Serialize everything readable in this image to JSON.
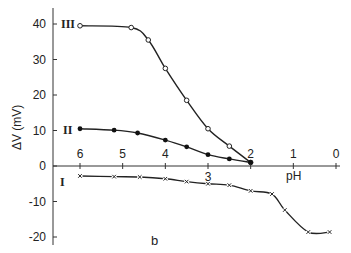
{
  "chart_data": {
    "type": "line",
    "title": "",
    "panel_label": "b",
    "xlabel": "pH",
    "ylabel": "ΔV (mV)",
    "xlim": [
      6,
      0
    ],
    "ylim": [
      -20,
      45
    ],
    "x_ticks": [
      6,
      5,
      4,
      3,
      2,
      1,
      0
    ],
    "y_ticks": [
      40,
      30,
      20,
      10,
      0,
      -10,
      -20
    ],
    "x_axis_reversed": true,
    "x_axis_at_y": 0,
    "grid": false,
    "legend": "inline curve labels (I, II, III)",
    "series": [
      {
        "name": "III",
        "marker": "open-circle",
        "x": [
          6.0,
          4.8,
          4.4,
          4.0,
          3.5,
          3.0,
          2.5,
          2.0
        ],
        "y": [
          39.5,
          39.0,
          35.5,
          27.5,
          18.5,
          10.5,
          5.6,
          1.0
        ]
      },
      {
        "name": "II",
        "marker": "filled-circle",
        "x": [
          6.0,
          5.2,
          4.65,
          4.0,
          3.5,
          3.0,
          2.5,
          2.0
        ],
        "y": [
          10.5,
          10.1,
          9.3,
          7.3,
          5.4,
          3.2,
          2.0,
          1.0
        ]
      },
      {
        "name": "I",
        "marker": "cross",
        "x": [
          6.0,
          5.2,
          4.6,
          4.0,
          3.5,
          3.0,
          2.5,
          2.0,
          1.5,
          1.2,
          0.65,
          0.15
        ],
        "y": [
          -2.8,
          -3.0,
          -3.1,
          -3.6,
          -4.4,
          -5.0,
          -5.4,
          -7.0,
          -7.9,
          -12.4,
          -18.6,
          -18.6
        ]
      }
    ]
  },
  "labels": {
    "panel": "b",
    "xlabel": "pH",
    "ylabel": "ΔV (mV)",
    "curve_I": "I",
    "curve_II": "II",
    "curve_III": "III"
  }
}
